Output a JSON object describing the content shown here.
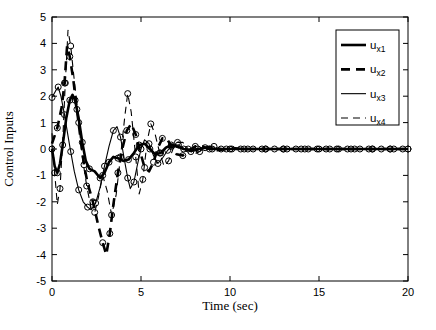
{
  "figure": {
    "background": "#ffffff",
    "line_color": "#000000",
    "plot_box": {
      "left": 52,
      "top": 17,
      "right": 408,
      "bottom": 281
    }
  },
  "chart_data": {
    "type": "line",
    "title": "",
    "xlabel": "Time (sec)",
    "ylabel": "Control Inputs",
    "xlim": [
      0,
      20
    ],
    "ylim": [
      -5,
      5
    ],
    "xticks": [
      "0",
      "5",
      "10",
      "15",
      "20"
    ],
    "xtick_values": [
      0,
      5,
      10,
      15,
      20
    ],
    "yticks": [
      "-5",
      "-4",
      "-3",
      "-2",
      "-1",
      "0",
      "1",
      "2",
      "3",
      "4",
      "5"
    ],
    "ytick_values": [
      -5,
      -4,
      -3,
      -2,
      -1,
      0,
      1,
      2,
      3,
      4,
      5
    ],
    "grid": false,
    "legend_position": "upper right",
    "series": [
      {
        "name": "u_x1",
        "style": "thick-solid",
        "marker": "o",
        "marker_every": 2,
        "marker_phase": 0,
        "points": [
          [
            0,
            0
          ],
          [
            0.15,
            -0.65
          ],
          [
            0.3,
            -0.9
          ],
          [
            0.45,
            -0.55
          ],
          [
            0.6,
            0.15
          ],
          [
            0.8,
            1.15
          ],
          [
            1.0,
            1.85
          ],
          [
            1.15,
            2.05
          ],
          [
            1.3,
            1.85
          ],
          [
            1.5,
            1.15
          ],
          [
            1.7,
            0.25
          ],
          [
            1.9,
            -0.45
          ],
          [
            2.1,
            -0.75
          ],
          [
            2.4,
            -0.85
          ],
          [
            2.7,
            -1.1
          ],
          [
            2.95,
            -0.9
          ],
          [
            3.2,
            -0.5
          ],
          [
            3.45,
            -0.3
          ],
          [
            3.7,
            -0.35
          ],
          [
            4.0,
            -0.45
          ],
          [
            4.3,
            -0.4
          ],
          [
            4.6,
            -0.15
          ],
          [
            4.9,
            0.15
          ],
          [
            5.2,
            0.2
          ],
          [
            5.5,
            0.0
          ],
          [
            5.8,
            -0.2
          ],
          [
            6.1,
            -0.15
          ],
          [
            6.4,
            0.05
          ],
          [
            6.7,
            0.15
          ],
          [
            7.0,
            0.1
          ],
          [
            7.4,
            0.0
          ],
          [
            7.8,
            -0.05
          ],
          [
            8.2,
            0.0
          ],
          [
            8.6,
            0.05
          ],
          [
            9.0,
            0.0
          ],
          [
            9.5,
            0.0
          ],
          [
            10,
            0
          ],
          [
            10.5,
            0
          ],
          [
            11,
            0
          ],
          [
            11.5,
            0
          ],
          [
            12,
            0
          ],
          [
            12.5,
            0
          ],
          [
            13,
            0
          ],
          [
            13.5,
            0
          ],
          [
            14,
            0
          ],
          [
            14.5,
            0
          ],
          [
            15,
            0
          ],
          [
            15.5,
            0
          ],
          [
            16,
            0
          ],
          [
            16.5,
            0
          ],
          [
            17,
            0
          ],
          [
            17.5,
            0
          ],
          [
            18,
            0
          ],
          [
            18.5,
            0
          ],
          [
            19,
            0
          ],
          [
            19.5,
            0
          ],
          [
            20,
            0
          ]
        ]
      },
      {
        "name": "u_x2",
        "style": "thick-dashed",
        "marker": "o",
        "marker_every": 2,
        "marker_phase": 1,
        "points": [
          [
            0,
            0.2
          ],
          [
            0.3,
            0.8
          ],
          [
            0.55,
            1.6
          ],
          [
            0.7,
            2.5
          ],
          [
            0.85,
            3.9
          ],
          [
            1.0,
            3.5
          ],
          [
            1.2,
            2.6
          ],
          [
            1.4,
            1.5
          ],
          [
            1.6,
            0.4
          ],
          [
            1.8,
            -0.6
          ],
          [
            2.0,
            -1.3
          ],
          [
            2.3,
            -2.0
          ],
          [
            2.6,
            -2.9
          ],
          [
            2.85,
            -3.55
          ],
          [
            3.05,
            -4.0
          ],
          [
            3.25,
            -3.2
          ],
          [
            3.45,
            -2.1
          ],
          [
            3.7,
            -0.9
          ],
          [
            3.95,
            0.0
          ],
          [
            4.2,
            0.7
          ],
          [
            4.45,
            0.95
          ],
          [
            4.7,
            0.55
          ],
          [
            4.95,
            -0.1
          ],
          [
            5.2,
            -0.7
          ],
          [
            5.45,
            -0.85
          ],
          [
            5.7,
            -0.5
          ],
          [
            5.95,
            0.05
          ],
          [
            6.2,
            0.4
          ],
          [
            6.45,
            0.4
          ],
          [
            6.7,
            0.1
          ],
          [
            7.0,
            -0.2
          ],
          [
            7.35,
            -0.25
          ],
          [
            7.7,
            -0.05
          ],
          [
            8.05,
            0.1
          ],
          [
            8.45,
            0.1
          ],
          [
            8.85,
            0.0
          ],
          [
            9.3,
            -0.05
          ],
          [
            9.8,
            0.0
          ],
          [
            10.3,
            0.03
          ],
          [
            10.8,
            0
          ],
          [
            11.4,
            0
          ],
          [
            12,
            0
          ],
          [
            12.6,
            0
          ],
          [
            13.2,
            0
          ],
          [
            13.8,
            0
          ],
          [
            14.4,
            0
          ],
          [
            15,
            0
          ],
          [
            15.6,
            0
          ],
          [
            16.2,
            0
          ],
          [
            16.8,
            0
          ],
          [
            17.4,
            0
          ],
          [
            18,
            0
          ],
          [
            18.6,
            0
          ],
          [
            19.2,
            0
          ],
          [
            20,
            0
          ]
        ]
      },
      {
        "name": "u_x3",
        "style": "thin-solid",
        "marker": "o",
        "marker_every": 2,
        "marker_phase": 0,
        "points": [
          [
            0,
            1.95
          ],
          [
            0.2,
            2.2
          ],
          [
            0.35,
            2.35
          ],
          [
            0.5,
            2.0
          ],
          [
            0.7,
            1.3
          ],
          [
            0.9,
            0.5
          ],
          [
            1.05,
            -0.1
          ],
          [
            1.25,
            -0.85
          ],
          [
            1.5,
            -1.55
          ],
          [
            1.75,
            -2.0
          ],
          [
            2.0,
            -2.2
          ],
          [
            2.2,
            -2.3
          ],
          [
            2.45,
            -2.05
          ],
          [
            2.7,
            -1.45
          ],
          [
            2.95,
            -0.65
          ],
          [
            3.2,
            0.1
          ],
          [
            3.45,
            0.7
          ],
          [
            3.65,
            0.85
          ],
          [
            3.85,
            0.45
          ],
          [
            4.05,
            -0.35
          ],
          [
            4.25,
            -1.1
          ],
          [
            4.4,
            -1.5
          ],
          [
            4.6,
            -1.25
          ],
          [
            4.8,
            -0.6
          ],
          [
            5.0,
            0.0
          ],
          [
            5.2,
            0.35
          ],
          [
            5.45,
            0.2
          ],
          [
            5.7,
            -0.25
          ],
          [
            5.95,
            -0.55
          ],
          [
            6.2,
            -0.35
          ],
          [
            6.5,
            -0.05
          ],
          [
            6.8,
            0.15
          ],
          [
            7.1,
            0.15
          ],
          [
            7.45,
            0.0
          ],
          [
            7.8,
            -0.1
          ],
          [
            8.2,
            -0.05
          ],
          [
            8.6,
            0.05
          ],
          [
            9.0,
            0.05
          ],
          [
            9.5,
            0.0
          ],
          [
            10,
            0
          ],
          [
            10.6,
            0
          ],
          [
            11.2,
            0
          ],
          [
            11.8,
            0
          ],
          [
            12.4,
            0
          ],
          [
            13,
            0
          ],
          [
            13.6,
            0
          ],
          [
            14.2,
            0
          ],
          [
            14.8,
            0
          ],
          [
            15.4,
            0
          ],
          [
            16,
            0
          ],
          [
            16.6,
            0
          ],
          [
            17.2,
            0
          ],
          [
            17.8,
            0
          ],
          [
            18.4,
            0
          ],
          [
            19,
            0
          ],
          [
            19.6,
            0
          ],
          [
            20,
            0
          ]
        ]
      },
      {
        "name": "u_x4",
        "style": "thin-dashed",
        "marker": "o",
        "marker_every": 2,
        "marker_phase": 1,
        "points": [
          [
            0,
            0.6
          ],
          [
            0.15,
            -0.9
          ],
          [
            0.3,
            -2.1
          ],
          [
            0.45,
            -1.5
          ],
          [
            0.6,
            0.3
          ],
          [
            0.75,
            2.5
          ],
          [
            0.9,
            4.5
          ],
          [
            1.05,
            3.9
          ],
          [
            1.25,
            2.6
          ],
          [
            1.5,
            1.0
          ],
          [
            1.7,
            -0.3
          ],
          [
            1.95,
            -1.4
          ],
          [
            2.2,
            -2.25
          ],
          [
            2.4,
            -2.4
          ],
          [
            2.6,
            -1.85
          ],
          [
            2.85,
            -1.0
          ],
          [
            3.1,
            -1.6
          ],
          [
            3.35,
            -2.5
          ],
          [
            3.6,
            -1.75
          ],
          [
            3.85,
            -0.3
          ],
          [
            4.1,
            1.3
          ],
          [
            4.25,
            2.1
          ],
          [
            4.45,
            1.4
          ],
          [
            4.7,
            -0.3
          ],
          [
            4.9,
            -1.7
          ],
          [
            5.1,
            -1.15
          ],
          [
            5.35,
            0.3
          ],
          [
            5.55,
            0.95
          ],
          [
            5.8,
            0.55
          ],
          [
            6.05,
            -0.15
          ],
          [
            6.3,
            -0.65
          ],
          [
            6.55,
            -0.45
          ],
          [
            6.8,
            0.0
          ],
          [
            7.05,
            0.25
          ],
          [
            7.35,
            0.25
          ],
          [
            7.65,
            0.0
          ],
          [
            7.95,
            -0.2
          ],
          [
            8.3,
            -0.1
          ],
          [
            8.7,
            0.1
          ],
          [
            9.1,
            0.1
          ],
          [
            9.6,
            0.0
          ],
          [
            10.1,
            0
          ],
          [
            10.7,
            0
          ],
          [
            11.3,
            0
          ],
          [
            11.9,
            0
          ],
          [
            12.5,
            0
          ],
          [
            13.1,
            0
          ],
          [
            13.7,
            0
          ],
          [
            14.3,
            0
          ],
          [
            14.9,
            0
          ],
          [
            15.5,
            0
          ],
          [
            16.1,
            0
          ],
          [
            16.7,
            0
          ],
          [
            17.3,
            0
          ],
          [
            17.9,
            0
          ],
          [
            18.5,
            0
          ],
          [
            19.1,
            0
          ],
          [
            19.7,
            0
          ],
          [
            20,
            0
          ]
        ]
      }
    ]
  },
  "legend": {
    "box": {
      "x": 336,
      "y": 30,
      "width": 63,
      "height": 95
    },
    "entries": [
      {
        "label": "u",
        "sub": "x1",
        "style": "thick-solid"
      },
      {
        "label": "u",
        "sub": "x2",
        "style": "thick-dashed"
      },
      {
        "label": "u",
        "sub": "x3",
        "style": "thin-solid"
      },
      {
        "label": "u",
        "sub": "x4",
        "style": "thin-dashed"
      }
    ]
  }
}
